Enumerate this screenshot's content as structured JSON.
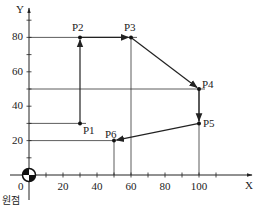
{
  "axes": {
    "x_label": "X",
    "y_label": "Y",
    "origin_label": "0",
    "origin_caption": "원점",
    "x_ticks": [
      {
        "label": "20",
        "value": 20
      },
      {
        "label": "40",
        "value": 40
      },
      {
        "label": "60",
        "value": 60
      },
      {
        "label": "80",
        "value": 80
      },
      {
        "label": "100",
        "value": 100
      }
    ],
    "y_ticks": [
      {
        "label": "20",
        "value": 20
      },
      {
        "label": "40",
        "value": 40
      },
      {
        "label": "60",
        "value": 60
      },
      {
        "label": "80",
        "value": 80
      }
    ]
  },
  "points": [
    {
      "name": "P1",
      "x": 30,
      "y": 30
    },
    {
      "name": "P2",
      "x": 30,
      "y": 80
    },
    {
      "name": "P3",
      "x": 60,
      "y": 80
    },
    {
      "name": "P4",
      "x": 100,
      "y": 50
    },
    {
      "name": "P5",
      "x": 100,
      "y": 30
    },
    {
      "name": "P6",
      "x": 50,
      "y": 20
    }
  ],
  "path_order": [
    "P1",
    "P2",
    "P3",
    "P4",
    "P5",
    "P6"
  ],
  "colors": {
    "line": "#222222",
    "background": "#ffffff"
  }
}
